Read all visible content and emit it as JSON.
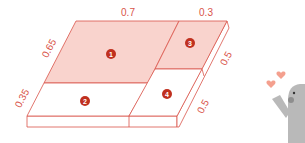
{
  "diagram": {
    "type": "probability-area-slab",
    "colors": {
      "line": "#d9544a",
      "shaded": "#f9d3cd",
      "badge": "#c0301f",
      "mascot_body": "#b9b9b9",
      "mascot_cheek": "#8e8e8e",
      "heart": "#f4a08e"
    },
    "dimensions": {
      "top_left": "0.7",
      "top_right": "0.3",
      "left_upper": "0.65",
      "left_lower": "0.35",
      "right_upper": "0.5",
      "right_lower": "0.5"
    },
    "regions": [
      {
        "id": "1",
        "label": "1",
        "shaded": true
      },
      {
        "id": "2",
        "label": "2",
        "shaded": false
      },
      {
        "id": "3",
        "label": "3",
        "shaded": true
      },
      {
        "id": "4",
        "label": "4",
        "shaded": false
      }
    ]
  },
  "mascot": {
    "icon": "waving-mascot-with-hearts"
  }
}
